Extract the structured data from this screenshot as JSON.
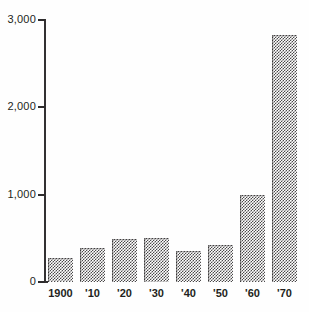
{
  "chart_data": {
    "type": "bar",
    "title": "",
    "subtitle": "",
    "xlabel": "",
    "ylabel": "",
    "categories": [
      "1900",
      "'10",
      "'20",
      "'30",
      "'40",
      "'50",
      "'60",
      "'70"
    ],
    "values": [
      275,
      390,
      485,
      500,
      355,
      425,
      990,
      2820
    ],
    "ylim": [
      0,
      3000
    ],
    "ytick_values": [
      0,
      1000,
      2000,
      3000
    ],
    "ytick_labels": [
      "0",
      "1,000",
      "2,000",
      "3,000"
    ],
    "grid": false,
    "legend": null,
    "series": [
      {
        "name": "",
        "values": [
          275,
          390,
          485,
          500,
          355,
          425,
          990,
          2820
        ]
      }
    ],
    "bar_fill": "#4c4a4b",
    "axis_color": "#231f20",
    "background": "#ffffff"
  },
  "axis": {
    "y_labels": [
      "3,000",
      "2,000",
      "1,000",
      "0"
    ],
    "x_labels": [
      "1900",
      "'10",
      "'20",
      "'30",
      "'40",
      "'50",
      "'60",
      "'70"
    ]
  }
}
